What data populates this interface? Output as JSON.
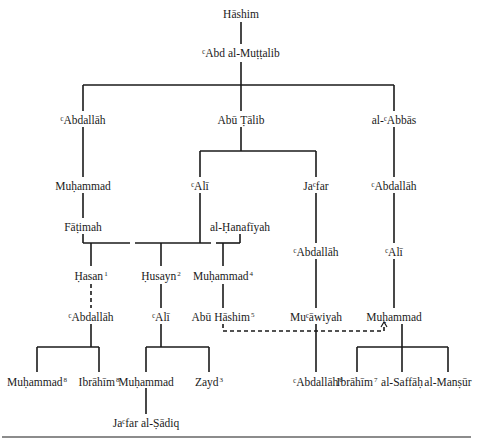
{
  "diagram": {
    "type": "genealogical-tree",
    "nodes": [
      {
        "id": "hashim",
        "label": "Hāshim",
        "sup": "",
        "x": 241,
        "y": 8
      },
      {
        "id": "abd_muttalib",
        "label": "ᶜAbd al-Muṭṭalib",
        "sup": "",
        "x": 241,
        "y": 47
      },
      {
        "id": "abdallah1",
        "label": "ᶜAbdallāh",
        "sup": "",
        "x": 83,
        "y": 114
      },
      {
        "id": "abu_talib",
        "label": "Abū Ṭālib",
        "sup": "",
        "x": 241,
        "y": 114
      },
      {
        "id": "abbas",
        "label": "al-ᶜAbbās",
        "sup": "",
        "x": 394,
        "y": 114
      },
      {
        "id": "muhammad_prophet",
        "label": "Muḥammad",
        "sup": "",
        "x": 83,
        "y": 180
      },
      {
        "id": "ali",
        "label": "ᶜAlī",
        "sup": "",
        "x": 200,
        "y": 180
      },
      {
        "id": "jafar",
        "label": "Jaᶜfar",
        "sup": "",
        "x": 316,
        "y": 180
      },
      {
        "id": "abdallah_abbas",
        "label": "ᶜAbdallāh",
        "sup": "",
        "x": 394,
        "y": 180
      },
      {
        "id": "fatimah",
        "label": "Fāṭimah",
        "sup": "",
        "x": 83,
        "y": 221
      },
      {
        "id": "hanafiyah",
        "label": "al-Ḥanafīyah",
        "sup": "",
        "x": 240,
        "y": 221
      },
      {
        "id": "abdallah_jafar",
        "label": "ᶜAbdallāh",
        "sup": "",
        "x": 316,
        "y": 246
      },
      {
        "id": "ali_abbas",
        "label": "ᶜAlī",
        "sup": "",
        "x": 394,
        "y": 246
      },
      {
        "id": "hasan",
        "label": "Ḥasan",
        "sup": "1",
        "x": 91,
        "y": 270
      },
      {
        "id": "husayn",
        "label": "Ḥusayn",
        "sup": "2",
        "x": 161,
        "y": 270
      },
      {
        "id": "muhammad_hanafiyah",
        "label": "Muḥammad",
        "sup": "4",
        "x": 223,
        "y": 270
      },
      {
        "id": "abdallah_hasan",
        "label": "ᶜAbdallāh",
        "sup": "",
        "x": 91,
        "y": 311
      },
      {
        "id": "ali_husayn",
        "label": "ᶜAlī",
        "sup": "",
        "x": 161,
        "y": 311
      },
      {
        "id": "abu_hashim",
        "label": "Abū Hāshim",
        "sup": "5",
        "x": 223,
        "y": 311
      },
      {
        "id": "muawiyah",
        "label": "Muᶜāwiyah",
        "sup": "",
        "x": 316,
        "y": 311
      },
      {
        "id": "muhammad_abbas",
        "label": "Muḥammad",
        "sup": "",
        "x": 394,
        "y": 311
      },
      {
        "id": "muhammad_nafs",
        "label": "Muḥammad",
        "sup": "8",
        "x": 37,
        "y": 376
      },
      {
        "id": "ibrahim_hasan",
        "label": "Ibrāhīm",
        "sup": "8",
        "x": 99,
        "y": 376
      },
      {
        "id": "muhammad_baqir",
        "label": "Muḥammad",
        "sup": "",
        "x": 146,
        "y": 376
      },
      {
        "id": "zayd",
        "label": "Zayd",
        "sup": "3",
        "x": 209,
        "y": 376
      },
      {
        "id": "abdallah_muawiyah",
        "label": "ᶜAbdallāh",
        "sup": "6",
        "x": 318,
        "y": 376
      },
      {
        "id": "ibrahim_abbas",
        "label": "Ibrāhīm",
        "sup": "7",
        "x": 357,
        "y": 376
      },
      {
        "id": "saffah",
        "label": "al-Saffāḥ",
        "sup": "",
        "x": 402,
        "y": 376
      },
      {
        "id": "mansur",
        "label": "al-Manṣūr",
        "sup": "",
        "x": 448,
        "y": 376
      },
      {
        "id": "jafar_sadiq",
        "label": "Jaᶜfar al-Ṣādiq",
        "sup": "",
        "x": 146,
        "y": 417
      }
    ],
    "dashed_links": [
      {
        "from": "hasan",
        "to": "abdallah_hasan"
      },
      {
        "from": "abu_hashim",
        "to": "muhammad_abbas",
        "style": "dashed-arrow"
      }
    ],
    "colors": {
      "line": "#1a1a1a",
      "text": "#1a1a1a",
      "background": "#ffffff"
    }
  }
}
